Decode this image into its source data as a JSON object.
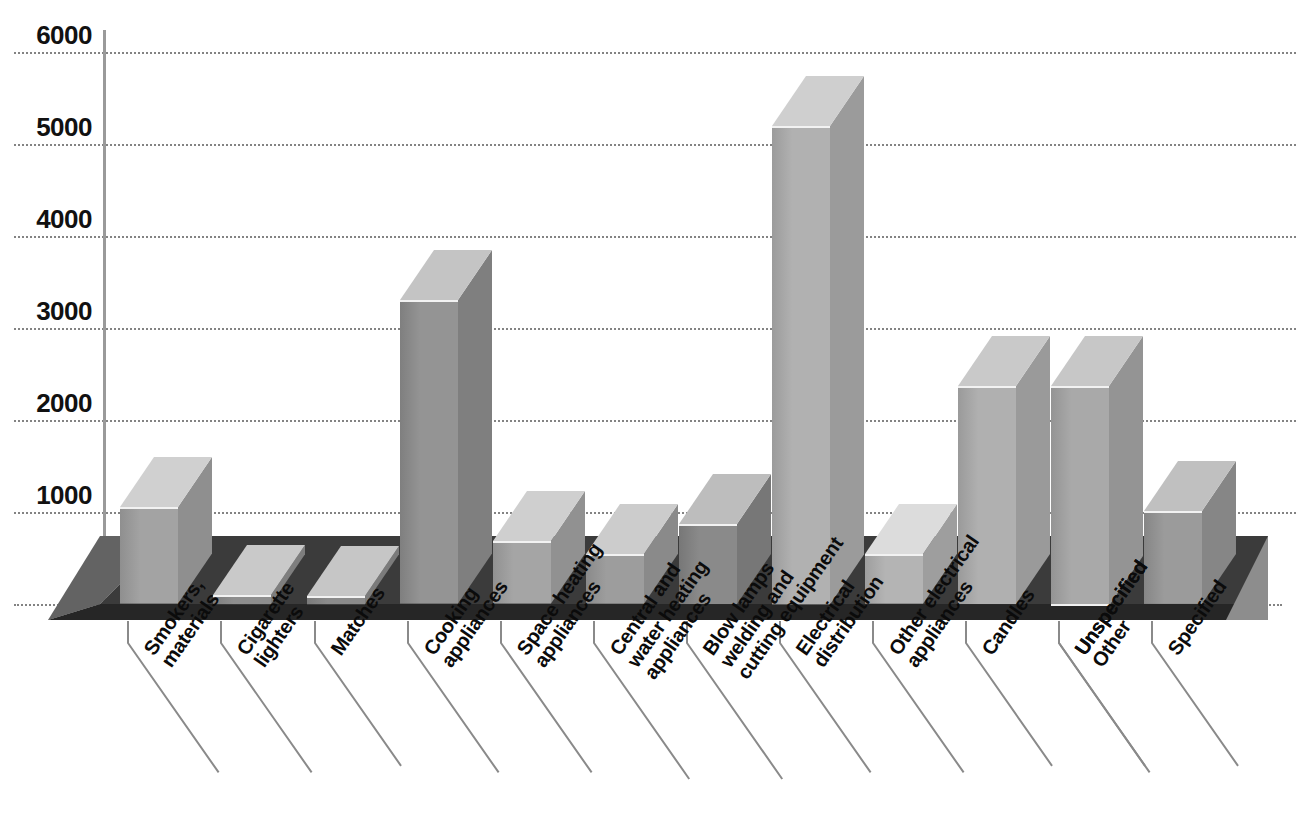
{
  "chart_data": {
    "type": "bar",
    "title": "",
    "subtitle": "",
    "xlabel": "",
    "ylabel": "",
    "ylim": [
      0,
      6000
    ],
    "ytick_values": [
      0,
      1000,
      2000,
      3000,
      4000,
      5000,
      6000
    ],
    "ytick_labels": [
      "0",
      "1000",
      "2000",
      "3000",
      "4000",
      "5000",
      "6000"
    ],
    "grid": true,
    "legend": false,
    "style": "3d-isometric-bars-on-dark-platform",
    "categories": [
      "Smokers, materials",
      "Cigarette lighters",
      "Matches",
      "Cooking appliances",
      "Space heating appliances",
      "Central and water heating appliances",
      "Blow lamps welding and cutting equipment",
      "Electrical distribution",
      "Other electrical appliances",
      "Candles",
      "Unspecified",
      "Other Unspecified",
      "Specified"
    ],
    "category_lines": [
      [
        "Smokers,",
        "materials"
      ],
      [
        "Cigarette",
        "lighters"
      ],
      [
        "Matches"
      ],
      [
        "Cooking",
        "appliances"
      ],
      [
        "Space heating",
        "appliances"
      ],
      [
        "Central and",
        "water heating",
        "appliances"
      ],
      [
        "Blow lamps",
        "welding and",
        "cutting equipment"
      ],
      [
        "Electrical",
        "distribution"
      ],
      [
        "Other electrical",
        "appliances"
      ],
      [
        "Candles"
      ],
      [
        "Unspecified"
      ],
      [
        "Unspecified",
        "Other"
      ],
      [
        "Specified"
      ]
    ],
    "values": [
      1050,
      100,
      90,
      3300,
      680,
      540,
      870,
      5200,
      540,
      2370,
      0,
      2370,
      1010
    ],
    "series": [
      {
        "name": "Fires by source of ignition",
        "values": [
          1050,
          100,
          90,
          3300,
          680,
          540,
          870,
          5200,
          540,
          2370,
          0,
          2370,
          1010
        ]
      }
    ],
    "bars": [
      {
        "label": "Smokers, materials",
        "value": 1050,
        "face": "#a3a3a3",
        "top": "#d0d0d0",
        "side": "#8f8f8f"
      },
      {
        "label": "Cigarette lighters",
        "value": 100,
        "face": "#8e8e8e",
        "top": "#c9c9c9",
        "side": "#7e7e7e"
      },
      {
        "label": "Matches",
        "value": 90,
        "face": "#8b8b8b",
        "top": "#c6c6c6",
        "side": "#7b7b7b"
      },
      {
        "label": "Cooking appliances",
        "value": 3300,
        "face": "#949494",
        "top": "#c4c4c4",
        "side": "#7f7f7f"
      },
      {
        "label": "Space heating appliances",
        "value": 680,
        "face": "#a5a5a5",
        "top": "#cfcfcf",
        "side": "#919191"
      },
      {
        "label": "Central and water heating appliances",
        "value": 540,
        "face": "#9d9d9d",
        "top": "#cccccc",
        "side": "#8a8a8a"
      },
      {
        "label": "Blow lamps welding and cutting equipment",
        "value": 870,
        "face": "#8a8a8a",
        "top": "#bdbdbd",
        "side": "#777777"
      },
      {
        "label": "Electrical distribution",
        "value": 5200,
        "face": "#b1b1b1",
        "top": "#cfcfcf",
        "side": "#9b9b9b"
      },
      {
        "label": "Other electrical appliances",
        "value": 540,
        "face": "#b4b4b4",
        "top": "#dcdcdc",
        "side": "#9e9e9e"
      },
      {
        "label": "Candles",
        "value": 2370,
        "face": "#b0b0b0",
        "top": "#c9c9c9",
        "side": "#9a9a9a"
      },
      {
        "label": "Unspecified",
        "value": 0,
        "face": "#a8a8a8",
        "top": "#cccccc",
        "side": "#939393"
      },
      {
        "label": "Other Unspecified",
        "value": 2370,
        "face": "#a9a9a9",
        "top": "#c7c7c7",
        "side": "#949494"
      },
      {
        "label": "Specified",
        "value": 1010,
        "face": "#9b9b9b",
        "top": "#c0c0c0",
        "side": "#868686"
      }
    ]
  },
  "colors": {
    "background": "#ffffff",
    "platform_top": "#3a3a3a",
    "platform_front": "#2a2a2a",
    "platform_side": "#6e6e6e",
    "gridline": "#7d7d7d",
    "axis_line": "#9a9a9a",
    "label_text": "#0b0b0b",
    "leader_line": "#8a8a8a"
  }
}
